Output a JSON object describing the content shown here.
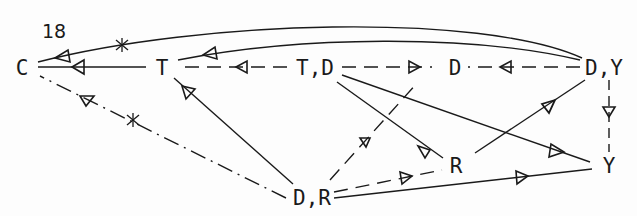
{
  "figure": {
    "number_label": "18",
    "nodes": {
      "C": "C",
      "T": "T",
      "TD": "T,D",
      "D": "D",
      "DY": "D,Y",
      "R": "R",
      "Y": "Y",
      "DR": "D,R"
    },
    "edge_legend": {
      "solid": "solid line with arrow",
      "dashed": "dashed line with arrow",
      "dash_dot": "dash-dot line with arrow",
      "asterisk_mark": "*"
    },
    "edges": [
      {
        "from": "D,Y",
        "to": "C",
        "style": "solid",
        "mark": "*"
      },
      {
        "from": "D,Y",
        "to": "T",
        "style": "solid"
      },
      {
        "from": "T",
        "to": "C",
        "style": "solid"
      },
      {
        "from": "T,D",
        "to": "T",
        "style": "dashed"
      },
      {
        "from": "T,D",
        "to": "D",
        "style": "dashed"
      },
      {
        "from": "D,Y",
        "to": "D",
        "style": "dashed"
      },
      {
        "from": "D,R",
        "to": "C",
        "style": "dash-dot",
        "mark": "*"
      },
      {
        "from": "D,R",
        "to": "T",
        "style": "solid"
      },
      {
        "from": "T,D",
        "to": "R",
        "style": "solid"
      },
      {
        "from": "T,D",
        "to": "Y",
        "style": "solid"
      },
      {
        "from": "R",
        "to": "D,Y",
        "style": "solid"
      },
      {
        "from": "D,Y",
        "to": "Y",
        "style": "dashed"
      },
      {
        "from": "D,R",
        "to": "D",
        "style": "dashed"
      },
      {
        "from": "D,R",
        "to": "R",
        "style": "dashed"
      },
      {
        "from": "D,R",
        "to": "Y",
        "style": "solid"
      }
    ]
  }
}
